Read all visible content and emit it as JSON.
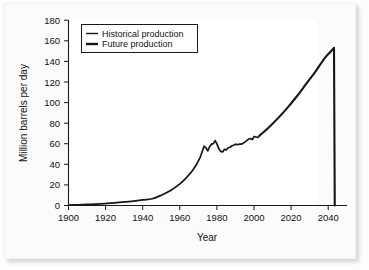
{
  "chart_data": {
    "type": "line",
    "title": "",
    "xlabel": "Year",
    "ylabel": "Million barrels per day",
    "xlim": [
      1900,
      2050
    ],
    "ylim": [
      0,
      180
    ],
    "grid": false,
    "legend_position": "top-left",
    "xticks": [
      1900,
      1920,
      1940,
      1960,
      1980,
      2000,
      2020,
      2040
    ],
    "xtick_labels": [
      "1900",
      "1920",
      "1940",
      "1960",
      "1980",
      "2000",
      "2020",
      "2040"
    ],
    "yticks": [
      0,
      20,
      40,
      60,
      80,
      100,
      120,
      140,
      160,
      180
    ],
    "ytick_labels": [
      "0",
      "20",
      "40",
      "60",
      "80",
      "100",
      "120",
      "140",
      "160",
      "180"
    ],
    "legend": [
      {
        "label": "Historical production",
        "color": "#161616",
        "line_width": 1.4
      },
      {
        "label": "Future production",
        "color": "#161616",
        "line_width": 2.4
      }
    ],
    "series": [
      {
        "name": "Historical production",
        "color": "#161616",
        "line_width": 1.7,
        "x": [
          1900,
          1905,
          1910,
          1915,
          1920,
          1925,
          1930,
          1935,
          1940,
          1945,
          1950,
          1955,
          1960,
          1963,
          1965,
          1967,
          1969,
          1971,
          1973,
          1974,
          1975,
          1976,
          1977,
          1978,
          1979,
          1980,
          1981,
          1982,
          1983,
          1984,
          1985,
          1986,
          1987,
          1988,
          1989,
          1990,
          1991,
          1992,
          1993,
          1994,
          1995,
          1996,
          1997,
          1998,
          1999,
          2000,
          2001,
          2002,
          2003
        ],
        "y": [
          0.4,
          0.7,
          1.0,
          1.3,
          1.9,
          2.6,
          3.6,
          4.2,
          5.5,
          6.5,
          10.0,
          14.5,
          21.0,
          26.0,
          30.0,
          34.5,
          40.0,
          47.0,
          57.5,
          56.0,
          53.0,
          57.0,
          59.5,
          60.0,
          63.0,
          59.5,
          55.0,
          52.5,
          52.0,
          54.5,
          54.0,
          56.0,
          56.5,
          58.0,
          58.5,
          59.5,
          59.0,
          59.5,
          59.5,
          60.5,
          61.5,
          63.0,
          64.5,
          65.0,
          64.0,
          67.0,
          66.5,
          66.0,
          68.0
        ]
      },
      {
        "name": "Future production",
        "color": "#161616",
        "line_width": 2.1,
        "x": [
          2003,
          2008,
          2013,
          2018,
          2023,
          2028,
          2033,
          2038,
          2041,
          2043,
          2043.4
        ],
        "y": [
          68.0,
          76.0,
          85.0,
          95.0,
          106.0,
          118.0,
          130.0,
          143.0,
          149.0,
          153.0,
          0.0
        ]
      }
    ],
    "annotations": [
      "Curve stays near zero from 1900 to 1930, then rises exponentially.",
      "Oscillation between 1973 and 2000 reflects oil shocks.",
      "Projected peak of about 153 million barrels per day near 2043, followed by a vertical drop to zero."
    ]
  }
}
